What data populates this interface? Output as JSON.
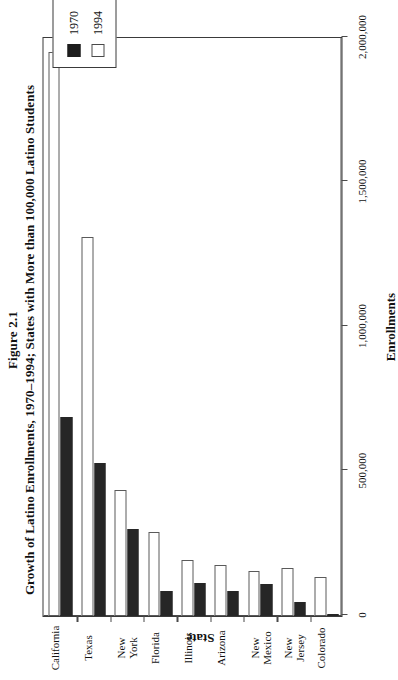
{
  "figure": {
    "number": "Figure 2.1",
    "caption": "Growth of Latino Enrollments, 1970–1994; States with More than 100,000 Latino Students"
  },
  "legend": {
    "items": [
      {
        "label": "1970",
        "swatch": "filled-black-square"
      },
      {
        "label": "1994",
        "swatch": "open-white-square"
      }
    ]
  },
  "axes": {
    "value_axis_title": "Enrollments",
    "category_axis_title": "State",
    "value_ticks": [
      "0",
      "500,000",
      "1,000,000",
      "1,500,000",
      "2,000,000"
    ]
  },
  "chart_data": {
    "type": "bar",
    "orientation": "horizontal",
    "title": "Growth of Latino Enrollments, 1970–1994; States with More than 100,000 Latino Students",
    "xlabel": "State",
    "ylabel": "Enrollments",
    "ylim": [
      0,
      2000000
    ],
    "yticks": [
      0,
      500000,
      1000000,
      1500000,
      2000000
    ],
    "ytick_labels": [
      "0",
      "500,000",
      "1,000,000",
      "1,500,000",
      "2,000,000"
    ],
    "grid": false,
    "legend_position": "top-right",
    "categories": [
      "California",
      "Texas",
      "New York",
      "Florida",
      "Illinois",
      "Arizona",
      "New Mexico",
      "New Jersey",
      "Colorado"
    ],
    "series": [
      {
        "name": "1970",
        "color": "#262626",
        "values": [
          690000,
          530000,
          300000,
          85000,
          115000,
          85000,
          110000,
          50000,
          5000
        ]
      },
      {
        "name": "1994",
        "color": "#ffffff",
        "values": [
          1950000,
          1310000,
          435000,
          290000,
          195000,
          175000,
          155000,
          165000,
          135000
        ]
      }
    ]
  }
}
